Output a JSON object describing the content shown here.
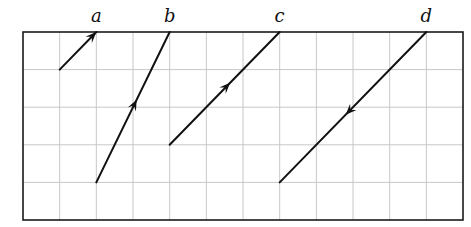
{
  "figure": {
    "grid": {
      "columns": 12,
      "rows": 5,
      "origin_px": [
        23,
        32
      ],
      "cell_px": 36.67
    },
    "colors": {
      "grid": "#c8c8c8",
      "frame": "#1a1a1a",
      "vector": "#111111"
    },
    "vectors": [
      {
        "label": "a",
        "from": [
          1,
          1
        ],
        "to": [
          2,
          0
        ],
        "arrow": "end"
      },
      {
        "label": "b",
        "from": [
          2,
          4
        ],
        "to": [
          4,
          0
        ],
        "arrow": "mid-forward"
      },
      {
        "label": "c",
        "from": [
          4,
          3
        ],
        "to": [
          7,
          0
        ],
        "arrow": "mid-forward"
      },
      {
        "label": "d",
        "from": [
          11,
          0
        ],
        "to": [
          7,
          4
        ],
        "arrow": "mid-forward"
      }
    ]
  }
}
